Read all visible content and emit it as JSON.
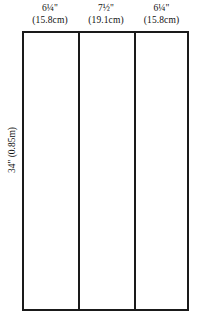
{
  "diagram": {
    "line_color": "#1a1a1a",
    "background_color": "#ffffff",
    "text_color": "#111111",
    "panels": [
      {
        "imperial": "6¼\"",
        "metric": "(15.8cm)"
      },
      {
        "imperial": "7½\"",
        "metric": "(19.1cm)"
      },
      {
        "imperial": "6¼\"",
        "metric": "(15.8cm)"
      }
    ],
    "height_label": "34\" (0.85m)"
  }
}
